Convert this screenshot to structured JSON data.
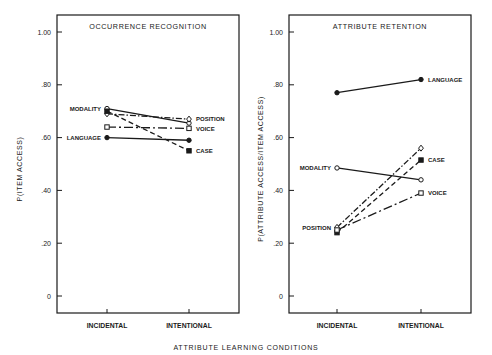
{
  "figure": {
    "xlabel_shared": "ATTRIBUTE LEARNING CONDITIONS"
  },
  "chart_data": [
    {
      "type": "line",
      "title": "OCCURRENCE RECOGNITION",
      "xlabel": "ATTRIBUTE LEARNING CONDITIONS",
      "ylabel": "P(ITEM ACCESS)",
      "categories": [
        "INCIDENTAL",
        "INTENTIONAL"
      ],
      "ylim": [
        0,
        1.0
      ],
      "yticks": [
        0,
        0.2,
        0.4,
        0.6,
        0.8,
        1.0
      ],
      "ytick_labels": [
        "0",
        ".20",
        ".40",
        ".60",
        ".80",
        "1.00"
      ],
      "grid": false,
      "legend": "inline labels",
      "series": [
        {
          "name": "MODALITY",
          "values": [
            0.71,
            0.655
          ],
          "marker": "open-circle",
          "line": "solid",
          "label_side": "left"
        },
        {
          "name": "POSITION",
          "values": [
            0.69,
            0.67
          ],
          "marker": "open-diamond",
          "line": "dash-dot",
          "label_side": "right"
        },
        {
          "name": "VOICE",
          "values": [
            0.64,
            0.635
          ],
          "marker": "open-square",
          "line": "dash-dot-long",
          "label_side": "right"
        },
        {
          "name": "CASE",
          "values": [
            0.7,
            0.55
          ],
          "marker": "filled-square",
          "line": "dashed",
          "label_side": "right"
        },
        {
          "name": "LANGUAGE",
          "values": [
            0.6,
            0.59
          ],
          "marker": "filled-circle",
          "line": "solid",
          "label_side": "left"
        }
      ]
    },
    {
      "type": "line",
      "title": "ATTRIBUTE RETENTION",
      "xlabel": "ATTRIBUTE LEARNING CONDITIONS",
      "ylabel": "P(ATTRIBUTE ACCESS/ITEM ACCESS)",
      "categories": [
        "INCIDENTAL",
        "INTENTIONAL"
      ],
      "ylim": [
        0,
        1.0
      ],
      "yticks": [
        0,
        0.2,
        0.4,
        0.6,
        0.8,
        1.0
      ],
      "ytick_labels": [
        "0",
        ".20",
        ".40",
        ".60",
        ".80",
        "1.00"
      ],
      "grid": false,
      "legend": "inline labels",
      "series": [
        {
          "name": "LANGUAGE",
          "values": [
            0.77,
            0.82
          ],
          "marker": "filled-circle",
          "line": "solid",
          "label_side": "right"
        },
        {
          "name": "MODALITY",
          "values": [
            0.485,
            0.44
          ],
          "marker": "open-circle",
          "line": "solid",
          "label_side": "left"
        },
        {
          "name": "POSITION",
          "values": [
            0.26,
            0.56
          ],
          "marker": "open-diamond",
          "line": "dash-dot",
          "label_side": "left"
        },
        {
          "name": "CASE",
          "values": [
            0.24,
            0.515
          ],
          "marker": "filled-square",
          "line": "dashed",
          "label_side": "right"
        },
        {
          "name": "VOICE",
          "values": [
            0.25,
            0.39
          ],
          "marker": "open-square",
          "line": "dash-dot-long",
          "label_side": "right"
        }
      ]
    }
  ]
}
